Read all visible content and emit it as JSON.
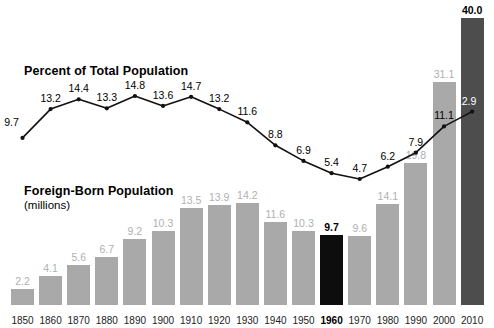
{
  "titles": {
    "percent_title": "Percent of Total Population",
    "foreign_title": "Foreign-Born Population",
    "foreign_sub": "(millions)"
  },
  "colors": {
    "bar_gray": "#a9a9a9",
    "bar_highlight": "#0d0d0d",
    "bar_latest": "#4d4d4d",
    "label_gray": "#b0b0b0",
    "label_black": "#000000",
    "label_white": "#ffffff",
    "line": "#111111"
  },
  "chart_data": {
    "type": "bar",
    "xlabel": "",
    "ylabel": "",
    "grid": false,
    "legend": "none",
    "categories": [
      "1850",
      "1860",
      "1870",
      "1880",
      "1890",
      "1900",
      "1910",
      "1920",
      "1930",
      "1940",
      "1950",
      "1960",
      "1970",
      "1980",
      "1990",
      "2000",
      "2010"
    ],
    "series": [
      {
        "name": "Foreign-Born Population",
        "unit": "millions",
        "type": "bar",
        "ylim": [
          0,
          40.0
        ],
        "values": [
          2.2,
          4.1,
          5.6,
          6.7,
          9.2,
          10.3,
          13.5,
          13.9,
          14.2,
          11.6,
          10.3,
          9.7,
          9.6,
          14.1,
          19.8,
          31.1,
          40.0
        ],
        "labels": [
          "2.2",
          "4.1",
          "5.6",
          "6.7",
          "9.2",
          "10.3",
          "13.5",
          "13.9",
          "14.2",
          "11.6",
          "10.3",
          "9.7",
          "9.6",
          "14.1",
          "19.8",
          "31.1",
          "40.0"
        ],
        "label_styles": [
          "gray",
          "gray",
          "gray",
          "gray",
          "gray",
          "gray",
          "gray",
          "gray",
          "gray",
          "gray",
          "gray",
          "black",
          "gray",
          "gray",
          "gray",
          "gray",
          "black"
        ],
        "bar_styles": [
          "gray",
          "gray",
          "gray",
          "gray",
          "gray",
          "gray",
          "gray",
          "gray",
          "gray",
          "gray",
          "gray",
          "highlight",
          "gray",
          "gray",
          "gray",
          "gray",
          "latest"
        ]
      },
      {
        "name": "Percent of Total Population",
        "unit": "percent",
        "type": "line",
        "ylim": [
          0,
          16
        ],
        "values": [
          9.7,
          13.2,
          14.4,
          13.3,
          14.8,
          13.6,
          14.7,
          13.2,
          11.6,
          8.8,
          6.9,
          5.4,
          4.7,
          6.2,
          7.9,
          11.1,
          12.9
        ],
        "labels": [
          "9.7",
          "13.2",
          "14.4",
          "13.3",
          "14.8",
          "13.6",
          "14.7",
          "13.2",
          "11.6",
          "8.8",
          "6.9",
          "5.4",
          "4.7",
          "6.2",
          "7.9",
          "11.1",
          "12.9"
        ],
        "label_styles": [
          "black",
          "black",
          "black",
          "black",
          "black",
          "black",
          "black",
          "black",
          "black",
          "black",
          "black",
          "black",
          "black",
          "black",
          "black",
          "black",
          "white"
        ]
      }
    ],
    "highlight_category": "1960"
  }
}
